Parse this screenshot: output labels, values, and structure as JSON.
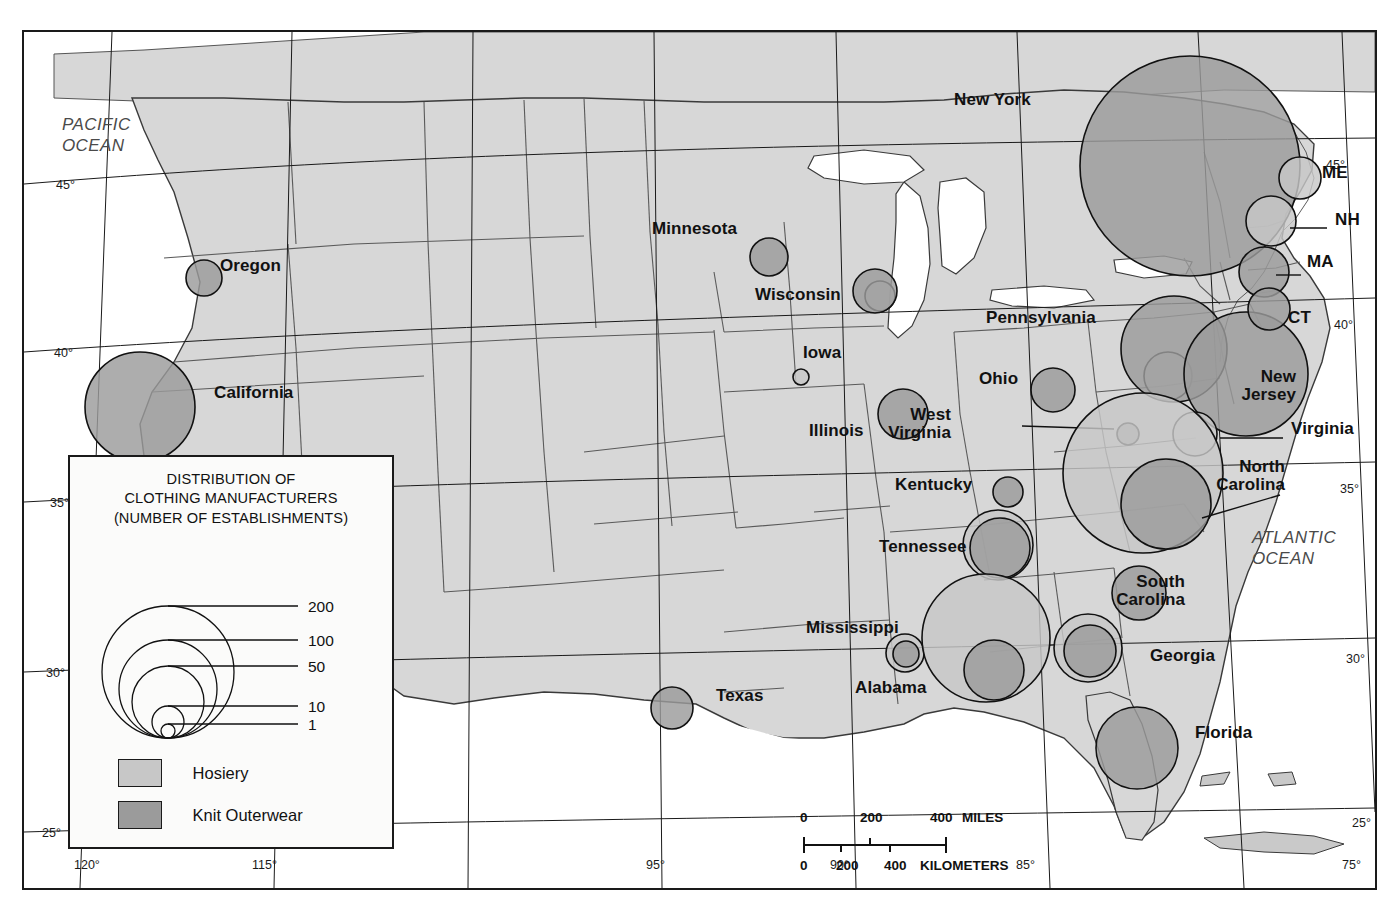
{
  "legend": {
    "title_lines": [
      "DISTRIBUTION OF",
      "CLOTHING MANUFACTURERS",
      "(NUMBER OF ESTABLISHMENTS)"
    ],
    "size_ticks": [
      "200",
      "100",
      "50",
      "10",
      "1"
    ],
    "keys": [
      {
        "label": "Hosiery",
        "color": "#c7c7c7"
      },
      {
        "label": "Knit Outerwear",
        "color": "#9b9b9b"
      }
    ]
  },
  "scalebar": {
    "miles_ticks": [
      "0",
      "200",
      "400"
    ],
    "miles_unit": "MILES",
    "km_ticks": [
      "0",
      "200",
      "400"
    ],
    "km_unit": "KILOMETERS"
  },
  "oceans": [
    {
      "name": "pacific-ocean",
      "lines": [
        "PACIFIC",
        "OCEAN"
      ],
      "x": 38,
      "y": 82
    },
    {
      "name": "atlantic-ocean",
      "lines": [
        "ATLANTIC",
        "OCEAN"
      ],
      "x": 1228,
      "y": 495
    }
  ],
  "graticule": {
    "left": [
      "45°",
      "40°",
      "35°",
      "30°",
      "25°"
    ],
    "right": [
      "45°",
      "40°",
      "35°",
      "30°",
      "25°"
    ],
    "bottom": [
      "120°",
      "115°",
      "95°",
      "90°",
      "85°",
      "75°"
    ]
  },
  "chart_data": {
    "type": "map",
    "title": "DISTRIBUTION OF CLOTHING MANUFACTURERS (NUMBER OF ESTABLISHMENTS)",
    "symbol": "proportional-circle",
    "scale_breaks": [
      1,
      10,
      50,
      100,
      200
    ],
    "series": [
      {
        "name": "Hosiery",
        "color": "#c7c7c7"
      },
      {
        "name": "Knit Outerwear",
        "color": "#9b9b9b"
      }
    ],
    "places": [
      {
        "state": "Oregon",
        "label": "Oregon",
        "label_x": 196,
        "label_y": 235,
        "lead": null,
        "knit": {
          "cx": 180,
          "cy": 246,
          "r": 18
        },
        "hosiery": null
      },
      {
        "state": "California",
        "label": "California",
        "label_x": 190,
        "label_y": 362,
        "lead": null,
        "knit": {
          "cx": 116,
          "cy": 375,
          "r": 55
        },
        "hosiery": null
      },
      {
        "state": "Minnesota",
        "label": "Minnesota",
        "label_x": 628,
        "label_y": 198,
        "lead": null,
        "knit": {
          "cx": 745,
          "cy": 225,
          "r": 19
        },
        "hosiery": null
      },
      {
        "state": "Wisconsin",
        "label": "Wisconsin",
        "label_x": 731,
        "label_y": 264,
        "lead": null,
        "knit": {
          "cx": 851,
          "cy": 259,
          "r": 22
        },
        "hosiery": {
          "cx": 856,
          "cy": 264,
          "r": 15
        }
      },
      {
        "state": "Iowa",
        "label": "Iowa",
        "label_x": 779,
        "label_y": 322,
        "lead": null,
        "knit": null,
        "hosiery": {
          "cx": 777,
          "cy": 345,
          "r": 8
        }
      },
      {
        "state": "Illinois",
        "label": "Illinois",
        "label_x": 785,
        "label_y": 400,
        "lead": null,
        "knit": {
          "cx": 879,
          "cy": 382,
          "r": 25
        },
        "hosiery": null
      },
      {
        "state": "Texas",
        "label": "Texas",
        "label_x": 692,
        "label_y": 665,
        "lead": null,
        "knit": {
          "cx": 648,
          "cy": 676,
          "r": 21
        },
        "hosiery": null
      },
      {
        "state": "Kentucky",
        "label": "Kentucky",
        "label_x": 871,
        "label_y": 454,
        "lead": null,
        "knit": {
          "cx": 984,
          "cy": 460,
          "r": 15
        },
        "hosiery": null
      },
      {
        "state": "Ohio",
        "label": "Ohio",
        "label_x": 955,
        "label_y": 348,
        "lead": null,
        "knit": {
          "cx": 1029,
          "cy": 358,
          "r": 22
        },
        "hosiery": null
      },
      {
        "state": "West Virginia",
        "label_lines": [
          "West",
          "Virginia"
        ],
        "label_x": 927,
        "label_y": 384,
        "lead": {
          "x1": 998,
          "y1": 394,
          "x2": 1090,
          "y2": 397
        },
        "knit": {
          "cx": 1104,
          "cy": 402,
          "r": 11
        },
        "hosiery": null
      },
      {
        "state": "Pennsylvania",
        "label": "Pennsylvania",
        "label_x": 962,
        "label_y": 287,
        "lead": null,
        "knit": {
          "cx": 1150,
          "cy": 317,
          "r": 53
        },
        "hosiery": {
          "cx": 1144,
          "cy": 344,
          "r": 24
        }
      },
      {
        "state": "New York",
        "label": "New York",
        "label_x": 930,
        "label_y": 69,
        "lead": null,
        "knit": {
          "cx": 1166,
          "cy": 134,
          "r": 110
        },
        "hosiery": null
      },
      {
        "state": "New Jersey",
        "label_lines": [
          "New",
          "Jersey"
        ],
        "label_x": 1272,
        "label_y": 346,
        "lead": null,
        "knit": {
          "cx": 1222,
          "cy": 342,
          "r": 62
        },
        "hosiery": null
      },
      {
        "state": "Virginia",
        "label": "Virginia",
        "label_x": 1267,
        "label_y": 398,
        "lead": {
          "x1": 1196,
          "y1": 406,
          "x2": 1259,
          "y2": 406
        },
        "knit": null,
        "hosiery": {
          "cx": 1171,
          "cy": 402,
          "r": 22
        }
      },
      {
        "state": "North Carolina",
        "label_lines": [
          "North",
          "Carolina"
        ],
        "label_x": 1261,
        "label_y": 436,
        "lead": {
          "x1": 1178,
          "y1": 486,
          "x2": 1256,
          "y2": 463
        },
        "knit": {
          "cx": 1142,
          "cy": 472,
          "r": 45
        },
        "hosiery": {
          "cx": 1119,
          "cy": 441,
          "r": 80
        }
      },
      {
        "state": "South Carolina",
        "label_lines": [
          "South",
          "Carolina"
        ],
        "label_x": 1161,
        "label_y": 551,
        "lead": null,
        "knit": {
          "cx": 1115,
          "cy": 561,
          "r": 27
        },
        "hosiery": null
      },
      {
        "state": "Georgia",
        "label": "Georgia",
        "label_x": 1126,
        "label_y": 625,
        "lead": null,
        "knit": {
          "cx": 1066,
          "cy": 619,
          "r": 26
        },
        "hosiery": {
          "cx": 1064,
          "cy": 616,
          "r": 34
        }
      },
      {
        "state": "Tennessee",
        "label": "Tennessee",
        "label_x": 855,
        "label_y": 516,
        "lead": null,
        "knit": {
          "cx": 976,
          "cy": 516,
          "r": 30
        },
        "hosiery": {
          "cx": 974,
          "cy": 513,
          "r": 35
        }
      },
      {
        "state": "Mississippi",
        "label": "Mississippi",
        "label_x": 782,
        "label_y": 597,
        "lead": null,
        "knit": {
          "cx": 882,
          "cy": 622,
          "r": 13
        },
        "hosiery": {
          "cx": 881,
          "cy": 621,
          "r": 19
        }
      },
      {
        "state": "Alabama",
        "label": "Alabama",
        "label_x": 831,
        "label_y": 657,
        "lead": null,
        "knit": {
          "cx": 970,
          "cy": 638,
          "r": 30
        },
        "hosiery": {
          "cx": 962,
          "cy": 606,
          "r": 64
        }
      },
      {
        "state": "Florida",
        "label": "Florida",
        "label_x": 1171,
        "label_y": 702,
        "lead": null,
        "knit": {
          "cx": 1113,
          "cy": 716,
          "r": 41
        },
        "hosiery": null
      },
      {
        "state": "Maine",
        "label": "ME",
        "label_x": 1298,
        "label_y": 142,
        "lead": null,
        "knit": null,
        "hosiery": {
          "cx": 1276,
          "cy": 146,
          "r": 21
        }
      },
      {
        "state": "New Hampshire",
        "label": "NH",
        "label_x": 1311,
        "label_y": 189,
        "lead": {
          "x1": 1266,
          "y1": 196,
          "x2": 1303,
          "y2": 196
        },
        "knit": null,
        "hosiery": {
          "cx": 1247,
          "cy": 189,
          "r": 25
        }
      },
      {
        "state": "Massachusetts",
        "label": "MA",
        "label_x": 1283,
        "label_y": 231,
        "lead": {
          "x1": 1252,
          "y1": 243,
          "x2": 1277,
          "y2": 243
        },
        "knit": {
          "cx": 1240,
          "cy": 240,
          "r": 25
        },
        "hosiery": null
      },
      {
        "state": "Connecticut",
        "label": "CT",
        "label_x": 1264,
        "label_y": 287,
        "lead": null,
        "knit": {
          "cx": 1245,
          "cy": 277,
          "r": 21
        },
        "hosiery": null
      }
    ]
  }
}
